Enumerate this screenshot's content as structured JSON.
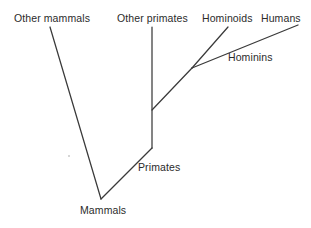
{
  "diagram": {
    "kind": "cladogram",
    "canvas": {
      "width": 311,
      "height": 228
    },
    "stroke_color": "#3a3a3a",
    "text_color": "#2b2b2b",
    "background_color": "#ffffff",
    "labels": {
      "other_mammals": "Other mammals",
      "other_primates": "Other primates",
      "hominoids": "Hominoids",
      "humans": "Humans",
      "hominins": "Hominins",
      "primates": "Primates",
      "mammals": "Mammals"
    },
    "nodes": [
      {
        "name": "mammals",
        "label": "Mammals",
        "x": 101,
        "y": 199,
        "type": "internal-node"
      },
      {
        "name": "primates",
        "label": "Primates",
        "x": 152,
        "y": 148,
        "type": "internal-node"
      },
      {
        "name": "hominoids-split",
        "label": "",
        "x": 192,
        "y": 68,
        "type": "internal-node"
      },
      {
        "name": "other-mammals-tip",
        "label": "Other mammals",
        "x": 50,
        "y": 27,
        "type": "tip"
      },
      {
        "name": "other-primates-tip",
        "label": "Other primates",
        "x": 152,
        "y": 27,
        "type": "tip"
      },
      {
        "name": "hominoids-tip",
        "label": "Hominoids",
        "x": 228,
        "y": 27,
        "type": "tip"
      },
      {
        "name": "humans-tip",
        "label": "Humans",
        "x": 298,
        "y": 25,
        "type": "tip"
      }
    ],
    "branches": [
      {
        "name": "branch-other-mammals",
        "from": "mammals",
        "to": "other-mammals-tip",
        "x1": 101,
        "y1": 199,
        "x2": 50,
        "y2": 27
      },
      {
        "name": "branch-mammals-to-primates",
        "from": "mammals",
        "to": "primates",
        "x1": 101,
        "y1": 199,
        "x2": 152,
        "y2": 148
      },
      {
        "name": "branch-other-primates",
        "from": "primates",
        "to": "other-primates-tip",
        "x1": 152,
        "y1": 148,
        "x2": 152,
        "y2": 27
      },
      {
        "name": "branch-primates-to-hominoids",
        "from": "primates",
        "to": "hominoids-split",
        "x1": 152,
        "y1": 110,
        "x2": 192,
        "y2": 68
      },
      {
        "name": "branch-hominoids",
        "from": "hominoids-split",
        "to": "hominoids-tip",
        "x1": 192,
        "y1": 68,
        "x2": 228,
        "y2": 27
      },
      {
        "name": "branch-hominins-humans",
        "from": "hominoids-split",
        "to": "humans-tip",
        "x1": 192,
        "y1": 68,
        "x2": 298,
        "y2": 25
      }
    ]
  }
}
